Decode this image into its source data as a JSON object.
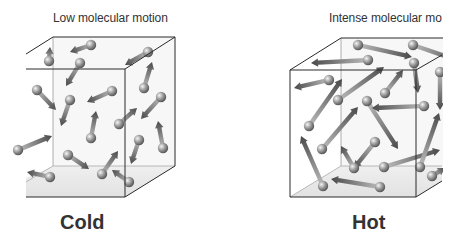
{
  "panels": [
    {
      "id": "cold",
      "caption": "Low molecular motion",
      "label": "Cold",
      "molecules": [
        {
          "ball": [
            91,
            45
          ],
          "tip": [
            70,
            52
          ]
        },
        {
          "ball": [
            49,
            61
          ],
          "tip": [
            50,
            47
          ]
        },
        {
          "ball": [
            80,
            63
          ],
          "tip": [
            66,
            86
          ]
        },
        {
          "ball": [
            148,
            52
          ],
          "tip": [
            125,
            65
          ]
        },
        {
          "ball": [
            37,
            90
          ],
          "tip": [
            56,
            110
          ]
        },
        {
          "ball": [
            70,
            100
          ],
          "tip": [
            61,
            126
          ]
        },
        {
          "ball": [
            112,
            91
          ],
          "tip": [
            87,
            102
          ]
        },
        {
          "ball": [
            144,
            88
          ],
          "tip": [
            152,
            62
          ]
        },
        {
          "ball": [
            161,
            97
          ],
          "tip": [
            141,
            119
          ]
        },
        {
          "ball": [
            119,
            124
          ],
          "tip": [
            137,
            108
          ]
        },
        {
          "ball": [
            91,
            138
          ],
          "tip": [
            96,
            111
          ]
        },
        {
          "ball": [
            163,
            148
          ],
          "tip": [
            158,
            121
          ]
        },
        {
          "ball": [
            139,
            140
          ],
          "tip": [
            131,
            164
          ]
        },
        {
          "ball": [
            68,
            155
          ],
          "tip": [
            89,
            169
          ]
        },
        {
          "ball": [
            102,
            174
          ],
          "tip": [
            118,
            151
          ]
        },
        {
          "ball": [
            50,
            177
          ],
          "tip": [
            27,
            172
          ]
        },
        {
          "ball": [
            129,
            182
          ],
          "tip": [
            112,
            170
          ]
        },
        {
          "ball": [
            18,
            150
          ],
          "tip": [
            52,
            136
          ]
        }
      ]
    },
    {
      "id": "hot",
      "caption": "Intense molecular mo",
      "label": "Hot",
      "molecules": [
        {
          "ball": [
            358,
            45
          ],
          "tip": [
            412,
            57
          ]
        },
        {
          "ball": [
            413,
            45
          ],
          "tip": [
            462,
            62
          ]
        },
        {
          "ball": [
            368,
            60
          ],
          "tip": [
            311,
            63
          ]
        },
        {
          "ball": [
            414,
            63
          ],
          "tip": [
            418,
            93
          ]
        },
        {
          "ball": [
            329,
            80
          ],
          "tip": [
            294,
            88
          ]
        },
        {
          "ball": [
            385,
            93
          ],
          "tip": [
            403,
            70
          ]
        },
        {
          "ball": [
            338,
            100
          ],
          "tip": [
            384,
            67
          ]
        },
        {
          "ball": [
            367,
            101
          ],
          "tip": [
            398,
            149
          ]
        },
        {
          "ball": [
            424,
            106
          ],
          "tip": [
            372,
            108
          ]
        },
        {
          "ball": [
            309,
            126
          ],
          "tip": [
            342,
            79
          ]
        },
        {
          "ball": [
            322,
            149
          ],
          "tip": [
            358,
            107
          ]
        },
        {
          "ball": [
            375,
            142
          ],
          "tip": [
            354,
            168
          ]
        },
        {
          "ball": [
            354,
            168
          ],
          "tip": [
            341,
            146
          ]
        },
        {
          "ball": [
            323,
            186
          ],
          "tip": [
            301,
            136
          ]
        },
        {
          "ball": [
            384,
            167
          ],
          "tip": [
            440,
            150
          ]
        },
        {
          "ball": [
            420,
            167
          ],
          "tip": [
            439,
            113
          ]
        },
        {
          "ball": [
            380,
            187
          ],
          "tip": [
            331,
            179
          ]
        },
        {
          "ball": [
            432,
            176
          ],
          "tip": [
            445,
            168
          ]
        },
        {
          "ball": [
            440,
            72
          ],
          "tip": [
            440,
            110
          ]
        }
      ]
    }
  ],
  "colors": {
    "line": "#2a2a2a",
    "ball_light": "#e0e0e0",
    "ball_dark": "#6a6a6a",
    "arrow_dark": "#4a4a4a",
    "arrow_light": "#bdbdbd",
    "floor": "#e9e9e9",
    "text": "#333333"
  }
}
